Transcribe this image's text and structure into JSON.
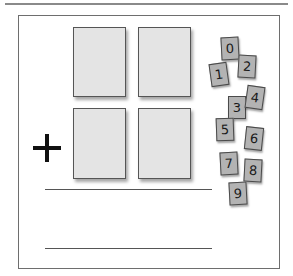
{
  "worksheet": {
    "operator": "+",
    "operator_name": "addition",
    "addend_rows": [
      {
        "label": "first-addend",
        "slots": [
          "",
          ""
        ]
      },
      {
        "label": "second-addend",
        "slots": [
          "",
          ""
        ]
      }
    ],
    "answer_lines": 2
  },
  "digit_cards": [
    {
      "value": "0",
      "x": 221,
      "y": 37,
      "rot": -3
    },
    {
      "value": "1",
      "x": 210,
      "y": 63,
      "rot": -8
    },
    {
      "value": "2",
      "x": 238,
      "y": 55,
      "rot": 3
    },
    {
      "value": "3",
      "x": 228,
      "y": 96,
      "rot": 0
    },
    {
      "value": "4",
      "x": 246,
      "y": 86,
      "rot": 8
    },
    {
      "value": "5",
      "x": 216,
      "y": 118,
      "rot": -2
    },
    {
      "value": "6",
      "x": 245,
      "y": 127,
      "rot": 6
    },
    {
      "value": "7",
      "x": 220,
      "y": 152,
      "rot": -3
    },
    {
      "value": "8",
      "x": 244,
      "y": 159,
      "rot": 3
    },
    {
      "value": "9",
      "x": 229,
      "y": 182,
      "rot": -3
    }
  ],
  "colors": {
    "slot_fill": "#e4e4e4",
    "card_fill": "#b3b3b3",
    "ink": "#111111",
    "frame": "#6e6e6e"
  }
}
